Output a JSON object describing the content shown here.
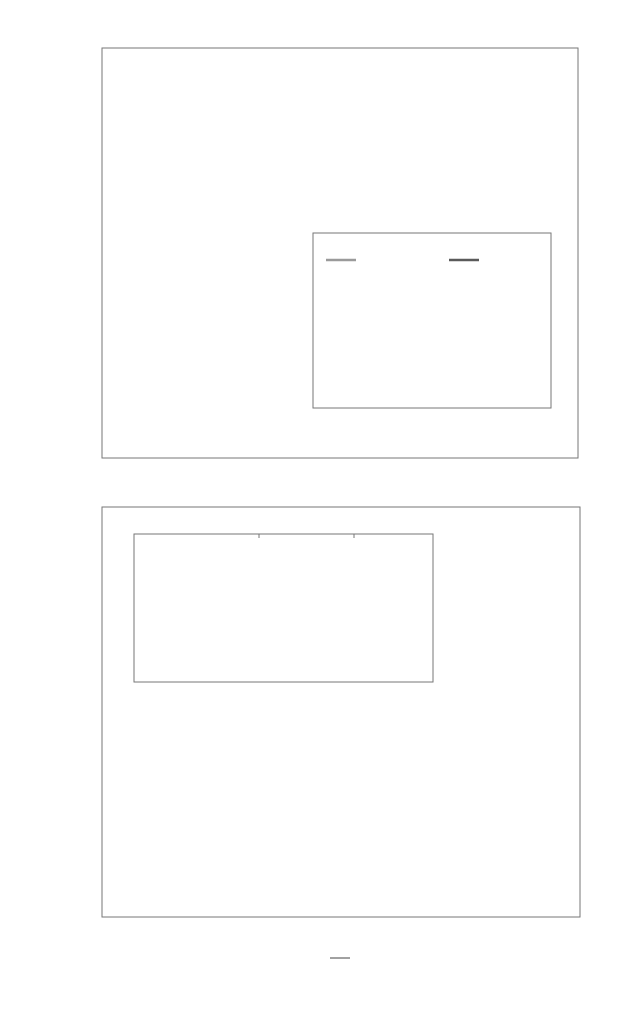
{
  "chart_data": [
    {
      "id": "top",
      "type": "line",
      "ylabel": "IPR(Λ_i)",
      "xscale": "log",
      "yscale": "log",
      "xlim": [
        0.01,
        1000
      ],
      "ylim": [
        1e-10,
        0.1
      ],
      "yticks": [
        "10^-1",
        "10^-2",
        "10^-3",
        "10^-4",
        "10^-5",
        "10^-6",
        "10^-7",
        "10^-8",
        "10^-9",
        "10^-10"
      ],
      "legend": {
        "position": "upper left",
        "entries": [
          "Λ_1^1",
          "Λ_1^2",
          "Λ_2^1",
          "Λ_2^2"
        ]
      },
      "series": [
        {
          "name": "Λ_1^1",
          "style": "solid",
          "color": "#7a7a7a",
          "x": [
            0.01,
            0.1,
            0.3,
            1,
            3,
            4,
            10,
            30,
            100,
            1000
          ],
          "y": [
            0.024,
            0.024,
            0.022,
            0.015,
            0.0085,
            0.0075,
            0.0062,
            0.0058,
            0.0057,
            0.0057
          ]
        },
        {
          "name": "Λ_1^2",
          "style": "solid",
          "color": "#cfcfcf",
          "x": [
            0.01,
            0.1,
            0.3,
            1,
            3,
            4,
            10,
            30,
            100,
            1000
          ],
          "y": [
            0.023,
            0.023,
            0.021,
            0.014,
            0.008,
            0.0068,
            0.006,
            0.0057,
            0.0056,
            0.0056
          ]
        },
        {
          "name": "Λ_2^1",
          "style": "dashed",
          "color": "#555555",
          "x": [
            0.01,
            0.03,
            0.1,
            0.3,
            1,
            2,
            3.5,
            4,
            5,
            10,
            30,
            100,
            1000
          ],
          "y": [
            2e-10,
            2e-08,
            2e-06,
            0.0001,
            0.0015,
            0.004,
            0.0062,
            0.012,
            0.019,
            0.021,
            0.02,
            0.019,
            0.019
          ]
        },
        {
          "name": "Λ_2^2",
          "style": "dashed",
          "color": "#b5b5b5",
          "x": [
            0.01,
            0.03,
            0.1,
            0.3,
            1,
            2,
            3.5,
            4,
            5,
            10,
            30,
            100,
            1000
          ],
          "y": [
            2e-10,
            2e-08,
            2e-06,
            0.0001,
            0.0015,
            0.004,
            0.0065,
            0.028,
            0.027,
            0.023,
            0.02,
            0.019,
            0.019
          ]
        }
      ]
    },
    {
      "id": "top-inset",
      "type": "line",
      "xscale": "log",
      "yscale": "log",
      "xlim": [
        0.01,
        1000
      ],
      "ylim": [
        0.01,
        0.1
      ],
      "xticks": [
        "10^-2",
        "10^-1",
        "10^0",
        "10^1",
        "10^2",
        "10^3"
      ],
      "yticks": [
        "10^-1",
        "10^-2"
      ],
      "legend": {
        "position": "upper",
        "entries": [
          "1st",
          "2nd"
        ]
      },
      "series": [
        {
          "name": "1st",
          "color": "#9a9a9a",
          "x": [
            0.01,
            0.1,
            0.3,
            0.6,
            1,
            2,
            4,
            10,
            30,
            100,
            1000
          ],
          "y": [
            0.0245,
            0.0242,
            0.022,
            0.017,
            0.0135,
            0.0112,
            0.0105,
            0.0102,
            0.0101,
            0.0101,
            0.0101
          ]
        },
        {
          "name": "2nd",
          "color": "#5a5a5a",
          "x": [
            0.01,
            0.1,
            0.3,
            0.6,
            1,
            2,
            3,
            3.8,
            4.0,
            5,
            10,
            30,
            100,
            1000
          ],
          "y": [
            0.0235,
            0.0232,
            0.021,
            0.016,
            0.013,
            0.0116,
            0.0125,
            0.018,
            0.053,
            0.049,
            0.043,
            0.037,
            0.035,
            0.035
          ]
        }
      ]
    },
    {
      "id": "bottom",
      "type": "line",
      "xlabel": "η / λ",
      "ylabel": "Λ_i",
      "xscale": "log",
      "yscale": "log",
      "xlim": [
        0.01,
        1000
      ],
      "ylim": [
        5.1,
        1000
      ],
      "xticks": [
        "10^-2",
        "10^-1",
        "10^0",
        "10^1",
        "10^2",
        "10^3"
      ],
      "yticks": [
        "10^3",
        "10^2",
        "10^1"
      ],
      "legend": {
        "position": "lower right",
        "entries": [
          "1st",
          "2nd",
          "3rd",
          "4th",
          "5th",
          "6th",
          "7th",
          "8th",
          "9th",
          "10th"
        ]
      },
      "series": [
        {
          "name": "1st",
          "color": "#9a9a9a",
          "x": [
            0.01,
            1,
            3,
            10,
            30,
            100,
            1000
          ],
          "y": [
            14.8,
            15.2,
            17.5,
            28,
            70,
            200,
            1000
          ]
        },
        {
          "name": "2nd",
          "color": "#6a6a6a",
          "x": [
            0.01,
            0.3,
            1,
            3,
            5,
            10,
            30,
            100,
            1000
          ],
          "y": [
            14.2,
            14.1,
            13.5,
            12.2,
            11.8,
            14,
            40,
            130,
            1000
          ]
        },
        {
          "name": "3rd",
          "color": "#777777",
          "x": [
            0.01,
            1,
            3,
            5,
            10,
            30,
            100,
            1000
          ],
          "y": [
            8.9,
            9.1,
            10.2,
            11.3,
            14,
            40,
            130,
            1000
          ]
        },
        {
          "name": "4th",
          "color": "#ffffff",
          "x": [
            0.01,
            1,
            3,
            10,
            30,
            100,
            1000
          ],
          "y": [
            8.7,
            8.9,
            9.9,
            13.7,
            39,
            128,
            1000
          ]
        },
        {
          "name": "5th",
          "color": "#666666",
          "x": [
            0.01,
            1,
            3,
            10,
            30,
            100,
            1000
          ],
          "y": [
            8.5,
            8.7,
            9.7,
            13.4,
            38,
            127,
            1000
          ]
        },
        {
          "name": "6th",
          "color": "#a0a0a0",
          "x": [
            0.01,
            1,
            3,
            10,
            30,
            100,
            1000
          ],
          "y": [
            8.3,
            8.5,
            9.5,
            13.2,
            37.5,
            126,
            1000
          ]
        },
        {
          "name": "7th",
          "color": "#d0d0d0",
          "x": [
            0.01,
            1,
            3,
            10,
            30,
            100,
            1000
          ],
          "y": [
            8.15,
            8.35,
            9.3,
            13.0,
            37,
            125,
            1000
          ]
        },
        {
          "name": "8th",
          "color": "#707070",
          "x": [
            0.01,
            1,
            3,
            10,
            30,
            100,
            1000
          ],
          "y": [
            8.0,
            8.2,
            9.1,
            12.8,
            36.5,
            124,
            1000
          ]
        },
        {
          "name": "9th",
          "color": "#9c9c9c",
          "x": [
            0.01,
            1,
            3,
            10,
            30,
            100,
            1000
          ],
          "y": [
            7.85,
            8.05,
            8.9,
            12.6,
            36,
            123,
            1000
          ]
        },
        {
          "name": "10th",
          "color": "#222222",
          "x": [
            0.01,
            1,
            3,
            10,
            30,
            100,
            1000
          ],
          "y": [
            7.7,
            7.9,
            8.7,
            12.3,
            35.5,
            122,
            1000
          ]
        }
      ]
    },
    {
      "id": "bottom-inset",
      "type": "line",
      "note": "zoomed view of curves crossing, no tick labels except 10^1 at lower-left",
      "yticks": [
        "10^1"
      ]
    }
  ],
  "labels": {
    "top_ylabel": "IPR(Λ",
    "top_ylabel_sub": "i",
    "top_ylabel_close": ")",
    "bottom_ylabel": "Λ",
    "bottom_ylabel_sub": "i",
    "xlabel_num": "η",
    "xlabel_den": "λ",
    "inset_legend_1": "1st",
    "inset_legend_2": "2nd",
    "inset_y_top": "10",
    "inset_y_top_exp": "-1",
    "inset_y_bot": "10",
    "inset_y_bot_exp": "-2",
    "bottom_inset_y": "10",
    "bottom_inset_y_exp": "1"
  },
  "top_legend": [
    {
      "base": "Λ",
      "sub": "1",
      "sup": "1",
      "style": "solid",
      "color": "#7a7a7a"
    },
    {
      "base": "Λ",
      "sub": "1",
      "sup": "2",
      "style": "solid",
      "color": "#dddddd"
    },
    {
      "base": "Λ",
      "sub": "2",
      "sup": "1",
      "style": "dashed",
      "color": "#555555"
    },
    {
      "base": "Λ",
      "sub": "2",
      "sup": "2",
      "style": "dashed",
      "color": "#bbbbbb"
    }
  ],
  "bottom_legend": [
    {
      "label": "1st",
      "color": "#9a9a9a"
    },
    {
      "label": "2nd",
      "color": "#6a6a6a"
    },
    {
      "label": "3rd",
      "color": "#777777"
    },
    {
      "label": "4th",
      "color": "#ffffff"
    },
    {
      "label": "5th",
      "color": "#666666"
    },
    {
      "label": "6th",
      "color": "#a0a0a0"
    },
    {
      "label": "7th",
      "color": "#d0d0d0"
    },
    {
      "label": "8th",
      "color": "#707070"
    },
    {
      "label": "9th",
      "color": "#9c9c9c"
    },
    {
      "label": "10th",
      "color": "#222222"
    }
  ]
}
